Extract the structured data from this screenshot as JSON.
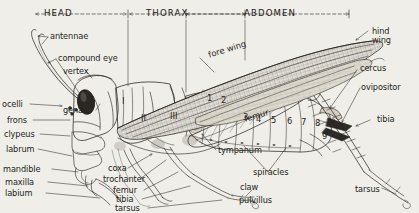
{
  "figure": {
    "background_color": "#efeee8",
    "ink_color": "#24211d",
    "width": 419,
    "height": 213
  },
  "body_regions": [
    {
      "name": "head",
      "label": "HEAD"
    },
    {
      "name": "thorax",
      "label": "THORAX"
    },
    {
      "name": "abdomen",
      "label": "ABDOMEN"
    }
  ],
  "head_labels": [
    {
      "name": "antennae",
      "label": "antennae"
    },
    {
      "name": "compound-eye",
      "label": "compound eye"
    },
    {
      "name": "vertex",
      "label": "vertex"
    },
    {
      "name": "ocelli",
      "label": "ocelli"
    },
    {
      "name": "gena",
      "label": "gena"
    },
    {
      "name": "frons",
      "label": "frons"
    },
    {
      "name": "clypeus",
      "label": "clypeus"
    },
    {
      "name": "labrum",
      "label": "labrum"
    },
    {
      "name": "mandible",
      "label": "mandible"
    },
    {
      "name": "maxilla",
      "label": "maxilla"
    },
    {
      "name": "labium",
      "label": "labium"
    }
  ],
  "leg_labels": [
    {
      "name": "coxa",
      "label": "coxa"
    },
    {
      "name": "trochanter",
      "label": "trochanter"
    },
    {
      "name": "femur",
      "label": "femur"
    },
    {
      "name": "tibia",
      "label": "tibia"
    },
    {
      "name": "tarsus",
      "label": "tarsus"
    },
    {
      "name": "claw",
      "label": "claw"
    },
    {
      "name": "pulvillus",
      "label": "pulvillus"
    }
  ],
  "hind_leg_labels": [
    {
      "name": "hind-femur",
      "label": "femur"
    },
    {
      "name": "hind-tibia",
      "label": "tibia"
    },
    {
      "name": "hind-tarsus",
      "label": "tarsus"
    }
  ],
  "wing_labels": [
    {
      "name": "fore-wing",
      "label": "fore wing"
    },
    {
      "name": "hind-wing-line1",
      "label": "hind"
    },
    {
      "name": "hind-wing-line2",
      "label": "wing"
    }
  ],
  "abdomen_labels": [
    {
      "name": "tympanum",
      "label": "tympanum"
    },
    {
      "name": "spiracles",
      "label": "spiracles"
    },
    {
      "name": "cercus",
      "label": "cercus"
    },
    {
      "name": "ovipositor",
      "label": "ovipositor"
    }
  ],
  "thoracic_segments": [
    {
      "name": "thoracic-segment-1",
      "label": "I"
    },
    {
      "name": "thoracic-segment-2",
      "label": "II"
    },
    {
      "name": "thoracic-segment-3",
      "label": "III"
    }
  ],
  "abdominal_segments": [
    {
      "name": "abdominal-segment-1",
      "label": "1"
    },
    {
      "name": "abdominal-segment-2",
      "label": "2"
    },
    {
      "name": "abdominal-segment-3",
      "label": "3"
    },
    {
      "name": "abdominal-segment-4",
      "label": "4"
    },
    {
      "name": "abdominal-segment-5",
      "label": "5"
    },
    {
      "name": "abdominal-segment-6",
      "label": "6"
    },
    {
      "name": "abdominal-segment-7",
      "label": "7"
    },
    {
      "name": "abdominal-segment-8",
      "label": "8"
    },
    {
      "name": "abdominal-segment-9",
      "label": "9"
    },
    {
      "name": "abdominal-segment-10",
      "label": "10"
    }
  ]
}
